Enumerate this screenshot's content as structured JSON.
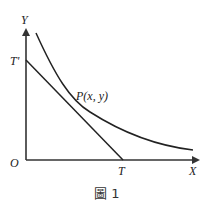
{
  "figure": {
    "caption": "圖 1",
    "labels": {
      "y_axis": "Y",
      "x_axis": "X",
      "origin": "O",
      "t_prime": "T'",
      "t_point": "T",
      "point_p": "P(x, y)"
    },
    "colors": {
      "axes": "#333333",
      "curve": "#222222",
      "tangent": "#222222",
      "text": "#222222"
    },
    "elements": {
      "curve": "decreasing convex curve",
      "tangent_line": "tangent at P from T' on Y-axis to T on X-axis"
    }
  }
}
